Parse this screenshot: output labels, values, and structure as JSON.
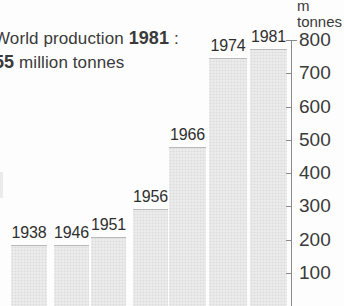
{
  "caption": {
    "line1_prefix": "World production",
    "line1_year": "1981",
    "line1_suffix": ":",
    "line2_amount": "55",
    "line2_text": "million tonnes"
  },
  "axis": {
    "title_line1": "m",
    "title_line2": "tonnes",
    "ticks": [
      "800",
      "700",
      "600",
      "500",
      "400",
      "300",
      "200",
      "100"
    ]
  },
  "chart_data": {
    "type": "bar",
    "xlabel": "",
    "ylabel": "m tonnes",
    "ylim": [
      0,
      800
    ],
    "grid": false,
    "legend": "none",
    "categories": [
      "1938",
      "1946",
      "1951",
      "1956",
      "1966",
      "1974",
      "1981"
    ],
    "values": [
      185,
      185,
      207,
      292,
      478,
      745,
      772
    ],
    "tick_labels": [
      "100",
      "200",
      "300",
      "400",
      "500",
      "600",
      "700",
      "800"
    ],
    "bar_color": "#dcdcdc",
    "annotations": [
      "World production 1981 :",
      "55 million tonnes"
    ]
  }
}
